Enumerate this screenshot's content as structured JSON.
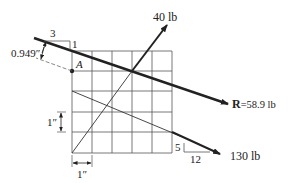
{
  "diagram": {
    "type": "force-vector-grid",
    "grid": {
      "columns": 5,
      "rows": 5,
      "cell_label_x": "1″",
      "cell_label_y": "1″"
    },
    "point": {
      "label": "A"
    },
    "forces": [
      {
        "name": "40 lb",
        "label": "40 lb",
        "direction": "up-right"
      },
      {
        "name": "130 lb",
        "label": "130 lb",
        "slope_rise": "5",
        "slope_run": "12"
      },
      {
        "name": "resultant",
        "symbol": "R",
        "label": "=58.9 lb",
        "slope_rise": "1",
        "slope_run": "3"
      }
    ],
    "distance": {
      "label": "0.949″"
    },
    "colors": {
      "line": "#222222",
      "grid": "#555555",
      "background": "#ffffff"
    }
  }
}
